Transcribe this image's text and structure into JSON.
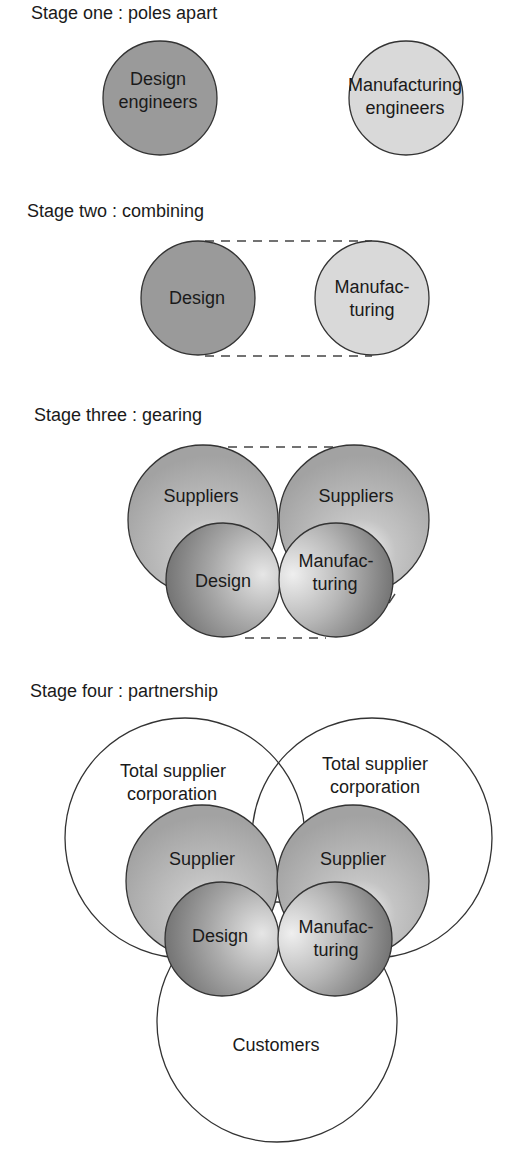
{
  "diagram": {
    "type": "staged-venn-evolution",
    "stages": [
      {
        "title": "Stage one : poles apart",
        "circles": [
          {
            "id": "design",
            "label_lines": [
              "Design",
              "engineers"
            ]
          },
          {
            "id": "manufacturing",
            "label_lines": [
              "Manufacturing",
              "engineers"
            ]
          }
        ]
      },
      {
        "title": "Stage two : combining",
        "circles": [
          {
            "id": "design",
            "label_lines": [
              "Design"
            ]
          },
          {
            "id": "manufacturing",
            "label_lines": [
              "Manufac-",
              "turing"
            ]
          }
        ],
        "connector": "dashed-bounding-lines"
      },
      {
        "title": "Stage three : gearing",
        "circles": [
          {
            "id": "suppliers-left",
            "label_lines": [
              "Suppliers"
            ]
          },
          {
            "id": "suppliers-right",
            "label_lines": [
              "Suppliers"
            ]
          },
          {
            "id": "design",
            "label_lines": [
              "Design"
            ]
          },
          {
            "id": "manufacturing",
            "label_lines": [
              "Manufac-",
              "turing"
            ]
          }
        ],
        "connector": "dashed-bounding-lines"
      },
      {
        "title": "Stage four : partnership",
        "circles": [
          {
            "id": "total-supplier-left",
            "label_lines": [
              "Total supplier",
              "corporation"
            ]
          },
          {
            "id": "total-supplier-right",
            "label_lines": [
              "Total supplier",
              "corporation"
            ]
          },
          {
            "id": "supplier-left",
            "label_lines": [
              "Supplier"
            ]
          },
          {
            "id": "supplier-right",
            "label_lines": [
              "Supplier"
            ]
          },
          {
            "id": "design",
            "label_lines": [
              "Design"
            ]
          },
          {
            "id": "manufacturing",
            "label_lines": [
              "Manufac-",
              "turing"
            ]
          },
          {
            "id": "customers",
            "label_lines": [
              "Customers"
            ]
          }
        ]
      }
    ]
  },
  "colors": {
    "design_fill": "#9a9a9a",
    "manufacturing_fill": "#d9d9d9",
    "supplier_fill": "#ababab",
    "outline": "#333333",
    "background": "#ffffff"
  }
}
